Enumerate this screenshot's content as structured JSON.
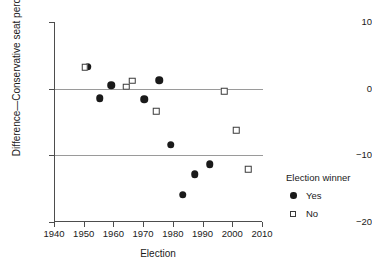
{
  "chart_data": {
    "type": "scatter",
    "title": "",
    "xlabel": "Election",
    "ylabel": "Difference—Conservative seat percentage",
    "xlim": [
      1940,
      2010
    ],
    "ylim": [
      -20,
      10
    ],
    "xticks": [
      1940,
      1950,
      1960,
      1970,
      1980,
      1990,
      2000,
      2010
    ],
    "xtick_labels": [
      "1940",
      "1950",
      "1960",
      "1970",
      "1980",
      "1990",
      "2000",
      "2010"
    ],
    "yticks": [
      10,
      0,
      -10,
      -20
    ],
    "ytick_labels": [
      "10",
      "0",
      "−10",
      "−20"
    ],
    "grid": "horizontal gridlines at y = 0 and y = -10",
    "legend": {
      "title": "Election winner",
      "position": "right outside",
      "entries": [
        {
          "label": "Yes",
          "marker": "filled-circle"
        },
        {
          "label": "No",
          "marker": "open-square"
        }
      ]
    },
    "series": [
      {
        "name": "Yes",
        "marker": "filled-circle",
        "color": "#1a1a1a",
        "points": [
          {
            "x": 1951,
            "y": 3.3
          },
          {
            "x": 1955,
            "y": -1.4
          },
          {
            "x": 1959,
            "y": 0.5
          },
          {
            "x": 1970,
            "y": -1.6
          },
          {
            "x": 1975,
            "y": 1.3
          },
          {
            "x": 1979,
            "y": -8.4
          },
          {
            "x": 1983,
            "y": -15.9
          },
          {
            "x": 1987,
            "y": -12.8
          },
          {
            "x": 1992,
            "y": -11.3
          }
        ]
      },
      {
        "name": "No",
        "marker": "open-square",
        "color": "#3a3a3a",
        "points": [
          {
            "x": 1950,
            "y": 3.2
          },
          {
            "x": 1964,
            "y": 0.3
          },
          {
            "x": 1966,
            "y": 1.2
          },
          {
            "x": 1974,
            "y": -3.4
          },
          {
            "x": 1997,
            "y": -0.4
          },
          {
            "x": 2001,
            "y": -6.2
          },
          {
            "x": 2005,
            "y": -12.1
          }
        ]
      }
    ]
  }
}
